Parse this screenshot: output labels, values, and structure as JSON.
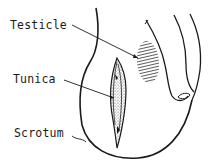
{
  "diagram": {
    "labels": {
      "testicle": "Testicle",
      "tunica": "Tunica",
      "scrotum": "Scrotum"
    },
    "colors": {
      "line": "#1a1a1a",
      "background": "#ffffff",
      "hatch": "#333333"
    }
  }
}
